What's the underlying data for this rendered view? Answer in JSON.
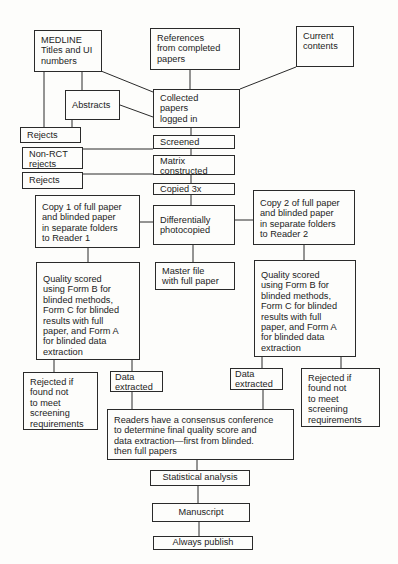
{
  "diagram": {
    "type": "flowchart",
    "nodes": {
      "medline": "MEDLINE\nTitles and UI\nnumbers",
      "references": "References\nfrom completed\npapers",
      "current_contents": "Current\ncontents",
      "abstracts": "Abstracts",
      "collected": "Collected\npapers\nlogged in",
      "rejects_1": "Rejects",
      "screened": "Screened",
      "non_rct": "Non-RCT\nrejects",
      "matrix": "Matrix\nconstructed",
      "rejects_2": "Rejects",
      "copied": "Copied 3x",
      "copy1": "Copy 1 of full paper\nand blinded paper\nin separate folders\nto Reader 1",
      "diff_photocopied": "Differentially\nphotocopied",
      "copy2": "Copy 2 of full paper\nand blinded paper\nin separate folders\nto Reader 2",
      "master_file": "Master file\nwith full paper",
      "quality_left": "Quality scored\nusing Form B for\nblinded methods,\nForm C for blinded\nresults with full\npaper, and Form A\nfor blinded data\nextraction",
      "quality_right": "Quality scored\nusing Form B for\nblinded methods,\nForm C for blinded\nresults with full\npaper, and Form A\nfor blinded data\nextraction",
      "rejected_left": "Rejected if\nfound not\nto meet\nscreening\nrequirements",
      "data_left": "Data\nextracted",
      "data_right": "Data\nextracted",
      "rejected_right": "Rejected if\nfound not\nto meet\nscreening\nrequirements",
      "readers": "Readers have a consensus conference\nto determine final quality score and\ndata extraction—first from blinded.\nthen full papers",
      "statistical": "Statistical analysis",
      "manuscript": "Manuscript",
      "publish": "Always publish"
    },
    "edges": [
      [
        "medline",
        "collected"
      ],
      [
        "medline",
        "abstracts"
      ],
      [
        "medline",
        "rejects_1"
      ],
      [
        "references",
        "collected"
      ],
      [
        "current_contents",
        "collected"
      ],
      [
        "abstracts",
        "collected"
      ],
      [
        "abstracts",
        "rejects_1"
      ],
      [
        "collected",
        "screened"
      ],
      [
        "screened",
        "non_rct"
      ],
      [
        "screened",
        "matrix"
      ],
      [
        "matrix",
        "rejects_2"
      ],
      [
        "matrix",
        "copied"
      ],
      [
        "copied",
        "diff_photocopied"
      ],
      [
        "diff_photocopied",
        "copy1"
      ],
      [
        "diff_photocopied",
        "copy2"
      ],
      [
        "diff_photocopied",
        "master_file"
      ],
      [
        "copy1",
        "quality_left"
      ],
      [
        "copy2",
        "quality_right"
      ],
      [
        "quality_left",
        "rejected_left"
      ],
      [
        "quality_left",
        "data_left"
      ],
      [
        "quality_right",
        "data_right"
      ],
      [
        "quality_right",
        "rejected_right"
      ],
      [
        "data_left",
        "readers"
      ],
      [
        "data_right",
        "readers"
      ],
      [
        "readers",
        "statistical"
      ],
      [
        "statistical",
        "manuscript"
      ],
      [
        "manuscript",
        "publish"
      ]
    ]
  }
}
